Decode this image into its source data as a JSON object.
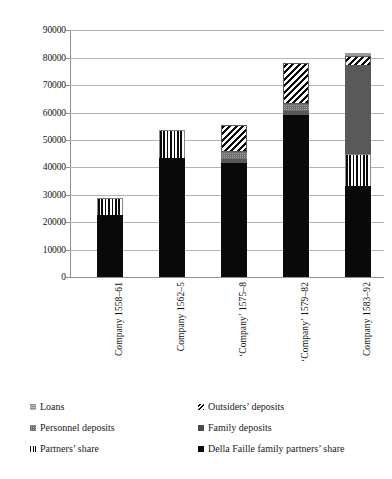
{
  "chart_data": {
    "type": "bar",
    "subtype": "stacked-bar",
    "title": "",
    "xlabel": "",
    "ylabel": "",
    "ylim": [
      0,
      90000
    ],
    "ytick_step": 10000,
    "grid": true,
    "legend_position": "bottom",
    "categories": [
      "Company 1558–61",
      "Company 1562–5",
      "‘Company’ 1575–8",
      "‘Company’ 1579–82",
      "Company 1583–92"
    ],
    "ytick_labels": [
      "0",
      "10000",
      "20000",
      "30000",
      "40000",
      "50000",
      "60000",
      "70000",
      "80000",
      "90000"
    ],
    "ytick_values": [
      0,
      10000,
      20000,
      30000,
      40000,
      50000,
      60000,
      70000,
      80000,
      90000
    ],
    "series": [
      {
        "name": "Della Faille family partners’ share",
        "fill": "solid-black",
        "values": [
          22700,
          43500,
          41500,
          59000,
          33000
        ]
      },
      {
        "name": "Partners’ share",
        "fill": "vertical-stripe",
        "values": [
          6000,
          10000,
          0,
          0,
          12000
        ]
      },
      {
        "name": "Family deposits",
        "fill": "dark-gray",
        "values": [
          0,
          0,
          1500,
          1500,
          32000
        ]
      },
      {
        "name": "Personnel deposits",
        "fill": "light-gray-hatch",
        "values": [
          0,
          0,
          2500,
          2500,
          0
        ]
      },
      {
        "name": "Outsiders’ deposits",
        "fill": "diagonal-stripe",
        "values": [
          0,
          0,
          10000,
          15000,
          3500
        ]
      },
      {
        "name": "Loans",
        "fill": "solid-gray",
        "values": [
          0,
          0,
          0,
          0,
          1300
        ]
      }
    ],
    "totals": [
      28700,
      53500,
      55500,
      78000,
      81800
    ]
  },
  "legend": {
    "columns": [
      {
        "items": [
          {
            "label": "Loans",
            "swatch": "solid-gray-swatch"
          },
          {
            "label": "Personnel deposits",
            "swatch": "light-gray-hatch-swatch"
          },
          {
            "label": "Partners’ share",
            "swatch": "vertical-stripe-swatch"
          }
        ]
      },
      {
        "items": [
          {
            "label": "Outsiders’ deposits",
            "swatch": "diagonal-stripe-swatch"
          },
          {
            "label": "Family deposits",
            "swatch": "dark-gray-swatch"
          },
          {
            "label": "Della Faille family partners’ share",
            "swatch": "solid-black-swatch"
          }
        ]
      }
    ]
  },
  "colors": {
    "black": "#0a0a0a",
    "dark_gray": "#595959",
    "light_gray": "#9a9a9a",
    "grid": "#b4b4b4",
    "axis": "#8f8f8f",
    "background": "#ffffff"
  }
}
